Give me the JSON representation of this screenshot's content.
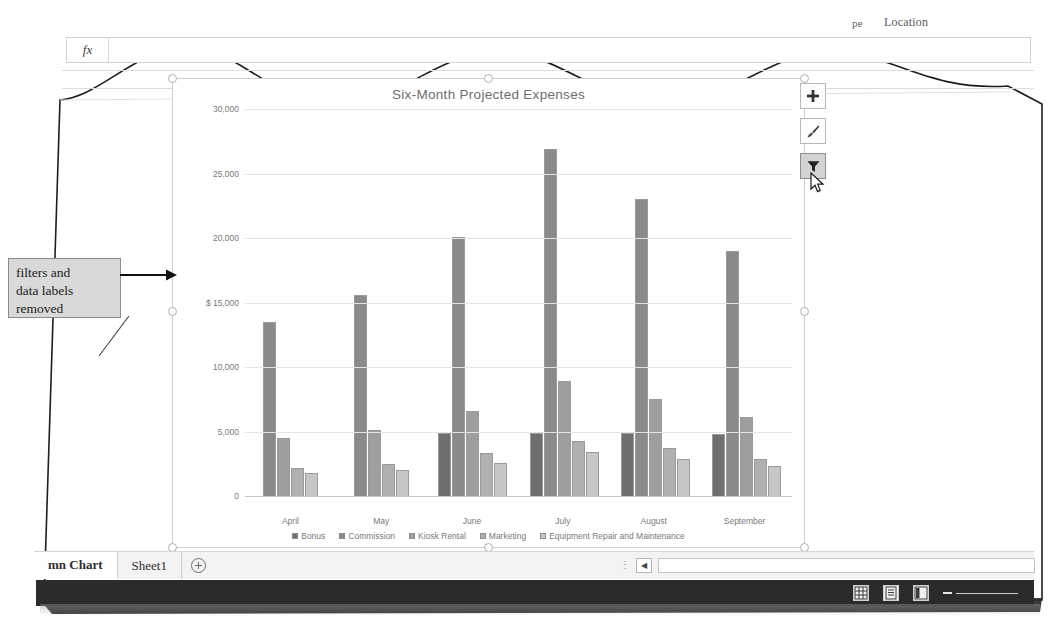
{
  "app": {
    "top_fragment_right": "Location",
    "formula_bar": {
      "fx_label": "fx",
      "value": "",
      "placeholder": ""
    }
  },
  "annotation": {
    "callout_text": "filters and data labels removed",
    "line1": "filters and",
    "line2": "data labels",
    "line3": "removed"
  },
  "chart_buttons": [
    {
      "name": "chart-elements-button",
      "glyph": "+",
      "active": false
    },
    {
      "name": "chart-styles-button",
      "glyph": "brush",
      "active": false
    },
    {
      "name": "chart-filters-button",
      "glyph": "funnel",
      "active": true
    }
  ],
  "sheet_tabs": [
    {
      "label": "mn Chart",
      "active": true
    },
    {
      "label": "Sheet1",
      "active": false
    }
  ],
  "add_sheet_label": "",
  "status_bar": {
    "views": [
      "normal-view",
      "page-layout-view",
      "page-break-preview"
    ],
    "zoom_minus": "−"
  },
  "chart_data": {
    "type": "bar",
    "title": "Six-Month Projected Expenses",
    "xlabel": "",
    "ylabel": "",
    "ylim": [
      0,
      30000
    ],
    "yticks": [
      0,
      5000,
      10000,
      15000,
      20000,
      25000,
      30000
    ],
    "ytick_labels": [
      "0",
      "5,000",
      "10,000",
      "$ 15,000",
      "20,000",
      "25,000",
      "30,000"
    ],
    "grid": true,
    "legend_position": "bottom",
    "categories": [
      "April",
      "May",
      "June",
      "July",
      "August",
      "September"
    ],
    "series": [
      {
        "name": "Bonus",
        "color": "#6f6f6f",
        "values": [
          null,
          null,
          4900,
          4850,
          4850,
          4800
        ]
      },
      {
        "name": "Commission",
        "color": "#8a8a8a",
        "values": [
          13500,
          15600,
          20100,
          26900,
          23000,
          19000
        ]
      },
      {
        "name": "Kiosk Rental",
        "color": "#9e9e9e",
        "values": [
          4500,
          5100,
          6600,
          8900,
          7500,
          6100
        ]
      },
      {
        "name": "Marketing",
        "color": "#b0b0b0",
        "values": [
          2200,
          2500,
          3300,
          4300,
          3700,
          2900
        ]
      },
      {
        "name": "Equipment Repair and Maintenance",
        "color": "#c6c6c6",
        "values": [
          1800,
          2050,
          2550,
          3450,
          2900,
          2300
        ]
      }
    ]
  }
}
